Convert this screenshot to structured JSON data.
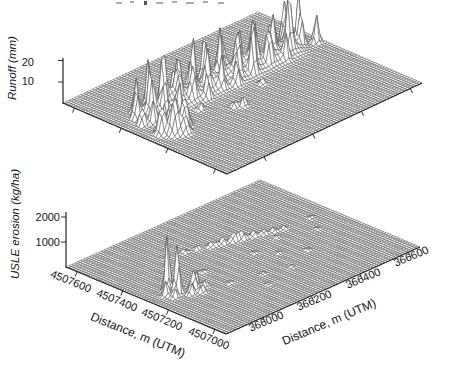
{
  "figure": {
    "kind": "scanned two-panel 3D wireframe surface figure",
    "top_caption_remnant": "illegible cropped text fragments along top edge"
  },
  "chart_data": [
    {
      "type": "surface",
      "panel": "top",
      "zlabel": "Runoff (mm)",
      "zticks": [
        10,
        20
      ],
      "zmax_est": 26,
      "x_axis": {
        "label": "Distance, m (UTM)",
        "ticks": [
          366000,
          366200,
          366400,
          366600
        ],
        "range_est": [
          365850,
          366650
        ],
        "tick_labels_shown": false
      },
      "y_axis": {
        "label": "Distance, m (UTM)",
        "ticks": [
          4507600,
          4507400,
          4507200,
          4507000
        ],
        "range_est": [
          4506950,
          4507650
        ],
        "tick_labels_shown": false
      },
      "summary": "Runoff near zero over most of the grid; a dense band of spikes 10-25 mm crosses the full easting range near mid-northing (~4507300-4507450 m N), with a secondary peak cluster near 366000 m E.",
      "peaks_frac_n_e_z": [
        [
          0.6,
          0.07,
          10
        ],
        [
          0.66,
          0.09,
          14
        ],
        [
          0.58,
          0.11,
          12
        ],
        [
          0.7,
          0.12,
          16
        ],
        [
          0.63,
          0.14,
          20
        ],
        [
          0.56,
          0.16,
          11
        ],
        [
          0.68,
          0.17,
          22
        ],
        [
          0.61,
          0.19,
          15
        ],
        [
          0.73,
          0.21,
          18
        ],
        [
          0.65,
          0.22,
          24
        ],
        [
          0.58,
          0.24,
          13
        ],
        [
          0.7,
          0.26,
          19
        ],
        [
          0.63,
          0.28,
          16
        ],
        [
          0.67,
          0.31,
          21
        ],
        [
          0.6,
          0.33,
          14
        ],
        [
          0.72,
          0.34,
          17
        ],
        [
          0.64,
          0.36,
          23
        ],
        [
          0.57,
          0.38,
          12
        ],
        [
          0.69,
          0.4,
          18
        ],
        [
          0.62,
          0.42,
          15
        ],
        [
          0.66,
          0.44,
          20
        ],
        [
          0.59,
          0.47,
          13
        ],
        [
          0.71,
          0.48,
          16
        ],
        [
          0.64,
          0.5,
          22
        ],
        [
          0.57,
          0.53,
          11
        ],
        [
          0.68,
          0.55,
          19
        ],
        [
          0.61,
          0.57,
          14
        ],
        [
          0.73,
          0.58,
          21
        ],
        [
          0.65,
          0.6,
          17
        ],
        [
          0.59,
          0.63,
          24
        ],
        [
          0.7,
          0.65,
          15
        ],
        [
          0.63,
          0.67,
          20
        ],
        [
          0.67,
          0.7,
          12
        ],
        [
          0.6,
          0.72,
          18
        ],
        [
          0.72,
          0.74,
          22
        ],
        [
          0.64,
          0.77,
          16
        ],
        [
          0.58,
          0.79,
          13
        ],
        [
          0.69,
          0.81,
          19
        ],
        [
          0.62,
          0.84,
          25
        ],
        [
          0.66,
          0.86,
          15
        ],
        [
          0.71,
          0.89,
          21
        ],
        [
          0.63,
          0.91,
          17
        ],
        [
          0.68,
          0.94,
          23
        ],
        [
          0.61,
          0.97,
          14
        ],
        [
          0.64,
          0.15,
          7,
          0.05
        ],
        [
          0.64,
          0.25,
          8,
          0.05
        ],
        [
          0.63,
          0.35,
          7,
          0.05
        ],
        [
          0.64,
          0.45,
          8,
          0.05
        ],
        [
          0.63,
          0.55,
          7,
          0.05
        ],
        [
          0.64,
          0.65,
          8,
          0.05
        ],
        [
          0.63,
          0.75,
          7,
          0.05
        ],
        [
          0.64,
          0.85,
          7,
          0.05
        ],
        [
          0.48,
          0.07,
          13,
          0.02
        ],
        [
          0.44,
          0.1,
          17,
          0.022
        ],
        [
          0.5,
          0.13,
          11,
          0.02
        ],
        [
          0.45,
          0.16,
          15,
          0.02
        ],
        [
          0.41,
          0.13,
          8,
          0.02
        ],
        [
          0.47,
          0.19,
          7
        ],
        [
          0.41,
          0.43,
          5
        ],
        [
          0.43,
          0.4,
          4
        ],
        [
          0.52,
          0.3,
          4
        ],
        [
          0.5,
          0.6,
          3
        ]
      ]
    },
    {
      "type": "surface",
      "panel": "bottom",
      "zlabel": "USLE erosion (kg/ha)",
      "zticks": [
        1000,
        2000
      ],
      "zmax_est": 2400,
      "x_axis": {
        "label": "Distance, m (UTM)",
        "ticks": [
          366000,
          366200,
          366400,
          366600
        ],
        "range_est": [
          365850,
          366650
        ],
        "tick_labels_shown": true
      },
      "y_axis": {
        "label": "Distance, m (UTM)",
        "ticks": [
          4507600,
          4507400,
          4507200,
          4507000
        ],
        "range_est": [
          4506950,
          4507650
        ],
        "tick_labels_shown": true
      },
      "summary": "Erosion near zero almost everywhere; two narrow spikes up to ~2000-2400 kg/ha near 366050-366100 m E / 4507250-4507300 m N, a smaller cluster beside them, a line of small peaks (~150-450 kg/ha) along a channel crossing the grid diagonally, and scattered tiny blips.",
      "peaks_frac_n_e_z": [
        [
          0.5,
          0.11,
          2400
        ],
        [
          0.45,
          0.12,
          2150
        ],
        [
          0.47,
          0.08,
          650
        ],
        [
          0.53,
          0.14,
          480
        ],
        [
          0.48,
          0.15,
          380
        ],
        [
          0.43,
          0.09,
          420
        ],
        [
          0.42,
          0.18,
          850,
          0.016
        ],
        [
          0.4,
          0.15,
          520
        ],
        [
          0.44,
          0.21,
          600
        ],
        [
          0.38,
          0.19,
          350
        ],
        [
          0.41,
          0.23,
          280
        ],
        [
          0.72,
          0.38,
          180
        ],
        [
          0.7,
          0.43,
          240
        ],
        [
          0.68,
          0.48,
          200
        ],
        [
          0.67,
          0.5,
          150
        ],
        [
          0.66,
          0.53,
          320
        ],
        [
          0.645,
          0.57,
          430
        ],
        [
          0.64,
          0.59,
          250
        ],
        [
          0.63,
          0.61,
          380
        ],
        [
          0.615,
          0.65,
          290
        ],
        [
          0.6,
          0.69,
          230
        ],
        [
          0.585,
          0.73,
          180
        ],
        [
          0.57,
          0.77,
          140
        ],
        [
          0.35,
          0.31,
          110
        ],
        [
          0.31,
          0.45,
          90
        ],
        [
          0.52,
          0.31,
          120
        ],
        [
          0.49,
          0.55,
          100
        ],
        [
          0.74,
          0.3,
          100
        ],
        [
          0.41,
          0.61,
          80
        ],
        [
          0.34,
          0.7,
          100
        ],
        [
          0.46,
          0.85,
          90
        ],
        [
          0.56,
          0.9,
          110
        ],
        [
          0.27,
          0.56,
          80
        ],
        [
          0.22,
          0.4,
          70
        ],
        [
          0.53,
          0.7,
          90
        ]
      ]
    }
  ]
}
